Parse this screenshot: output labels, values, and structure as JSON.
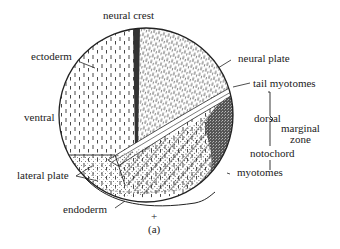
{
  "figure": {
    "panel_label": "(a)",
    "center_symbol": "+",
    "labels": {
      "neural_crest": "neural crest",
      "ectoderm": "ectoderm",
      "neural_plate": "neural plate",
      "tail_myotomes": "tail myotomes",
      "ventral": "ventral",
      "dorsal": "dorsal",
      "marginal_zone_line1": "marginal",
      "marginal_zone_line2": "zone",
      "notochord": "notochord",
      "lateral_plate": "lateral plate",
      "myotomes": "myotomes",
      "endoderm": "endoderm"
    },
    "colors": {
      "ink": "#222222",
      "background": "#ffffff",
      "notochord_fill": "#3a3a3a"
    }
  }
}
